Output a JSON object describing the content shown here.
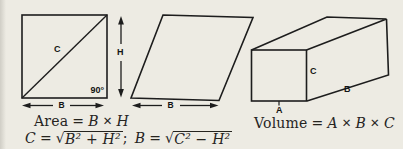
{
  "canvas": {
    "paper_color": "#edebe3",
    "ink_color": "#1d1d1d",
    "description": "Textbook geometry figure: rectangle with diagonal, parallelogram, rectangular prism, with area and volume formulas"
  },
  "figures": {
    "rectangle": {
      "diagonal_label": "C",
      "height_label": "H",
      "base_label": "B",
      "right_angle_label": "90°"
    },
    "parallelogram": {
      "base_label": "B"
    },
    "box": {
      "front_edge_label": "A",
      "length_label": "B",
      "height_label": "C"
    }
  },
  "formulas": {
    "area": {
      "label": "Area",
      "equals": "=",
      "term1": "B",
      "times": "✕",
      "term2": "H"
    },
    "pythagorean": {
      "lhs1": "C",
      "eq1": "=",
      "rad1": "√",
      "radicand1": "B² + H²",
      "separator": ";",
      "lhs2": "B",
      "eq2": "=",
      "rad2": "√",
      "radicand2": "C² − H²"
    },
    "volume": {
      "label": "Volume",
      "equals": "=",
      "term1": "A",
      "times1": "✕",
      "term2": "B",
      "times2": "✕",
      "term3": "C"
    }
  }
}
